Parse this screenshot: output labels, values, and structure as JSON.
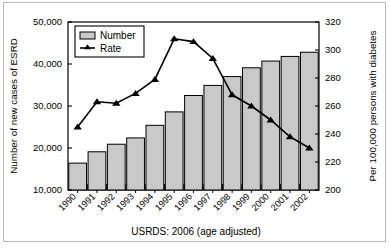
{
  "chart_data": {
    "type": "bar",
    "title": "",
    "subtitle": "",
    "caption": "USRDS: 2006 (age adjusted)",
    "xlabel": "",
    "ylabel": "Number of new cases of ESRD",
    "y2label": "Per 100,000 persons with diabetes",
    "categories": [
      "1990",
      "1991",
      "1992",
      "1993",
      "1994",
      "1995",
      "1996",
      "1997",
      "1998",
      "1999",
      "2000",
      "2001",
      "2002"
    ],
    "ylim": [
      10000,
      50000
    ],
    "y2lim": [
      200,
      320
    ],
    "yticks": [
      "10,000",
      "20,000",
      "30,000",
      "40,000",
      "50,000"
    ],
    "ytick_values": [
      10000,
      20000,
      30000,
      40000,
      50000
    ],
    "y2ticks": [
      "200",
      "220",
      "240",
      "260",
      "280",
      "300",
      "320"
    ],
    "y2tick_values": [
      200,
      220,
      240,
      260,
      280,
      300,
      320
    ],
    "grid": false,
    "legend_position": "top-left",
    "series": [
      {
        "name": "Number",
        "type": "bar",
        "axis": "left",
        "color": "#c9c9c9",
        "edge_color": "#000000",
        "values": [
          16400,
          19100,
          20900,
          22400,
          25400,
          28600,
          32500,
          34900,
          37000,
          39100,
          40700,
          41800,
          42800
        ]
      },
      {
        "name": "Rate",
        "type": "line",
        "axis": "right",
        "color": "#000000",
        "marker": "triangle",
        "values": [
          245,
          263,
          262,
          269,
          279,
          308,
          306,
          294,
          268,
          260,
          250,
          238,
          230
        ]
      }
    ]
  },
  "legend": {
    "items": [
      {
        "label": "Number",
        "swatch": "bar-swatch"
      },
      {
        "label": "Rate",
        "swatch": "line-marker-swatch"
      }
    ]
  }
}
